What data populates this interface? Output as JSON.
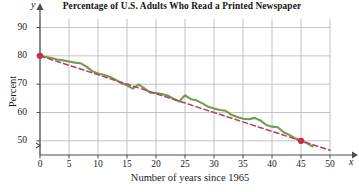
{
  "chart_data": {
    "type": "line",
    "title": "Percentage of U.S. Adults Who Read a Printed Newspaper",
    "xlabel": "Number of years since 1965",
    "ylabel": "Percent",
    "x_axis_variable": "x",
    "y_axis_variable": "y",
    "xlim": [
      0,
      50
    ],
    "ylim": [
      45,
      93
    ],
    "grid": true,
    "y_axis_break": true,
    "xticks": [
      0,
      5,
      10,
      15,
      20,
      25,
      30,
      35,
      40,
      45,
      50
    ],
    "xtick_labels": [
      "0",
      "5",
      "10",
      "15",
      "20",
      "25",
      "30",
      "35",
      "40",
      "45",
      "50"
    ],
    "yticks": [
      50,
      60,
      70,
      80,
      90
    ],
    "ytick_labels": [
      "50",
      "60",
      "70",
      "80",
      "90"
    ],
    "legend": null,
    "series": [
      {
        "name": "Percent of U.S. adults who read a printed newspaper",
        "kind": "line",
        "color": "#6d9e52",
        "style": "solid",
        "x": [
          0,
          1,
          2,
          3,
          4,
          5,
          6,
          7,
          8,
          9,
          10,
          11,
          12,
          13,
          14,
          15,
          16,
          17,
          18,
          19,
          20,
          21,
          22,
          23,
          24,
          25,
          26,
          27,
          28,
          29,
          30,
          31,
          32,
          33,
          34,
          35,
          36,
          37,
          38,
          39,
          40,
          41,
          42,
          43,
          44,
          45,
          46,
          47
        ],
        "values": [
          80.0,
          79.6,
          79.2,
          78.7,
          78.4,
          78.0,
          77.6,
          77.4,
          76.2,
          74.6,
          73.8,
          73.3,
          72.6,
          71.6,
          70.4,
          69.6,
          68.4,
          69.9,
          68.5,
          67.0,
          66.9,
          66.5,
          66.0,
          64.9,
          63.9,
          66.1,
          64.7,
          64.3,
          63.2,
          62.0,
          61.4,
          60.9,
          60.6,
          59.2,
          58.4,
          57.8,
          57.6,
          58.1,
          57.2,
          55.6,
          55.0,
          54.8,
          53.0,
          52.1,
          50.9,
          50.0,
          49.2,
          48.0
        ]
      },
      {
        "name": "Linear regression trend line",
        "kind": "line",
        "color": "#bf3b63",
        "style": "dashed",
        "x": [
          0,
          45,
          50
        ],
        "values": [
          80.0,
          50.0,
          46.7
        ]
      }
    ],
    "markers": [
      {
        "label": "start point",
        "x": 0,
        "y": 80,
        "color": "#c8304f"
      },
      {
        "label": "end point",
        "x": 45,
        "y": 50,
        "color": "#c8304f"
      }
    ],
    "colors": {
      "data_line": "#6d9e52",
      "trend_line": "#bf3b63",
      "marker": "#c8304f",
      "grid": "#b4b4b4",
      "axis": "#4d4d4d",
      "text": "#1a1a1a",
      "background": "#ffffff"
    }
  }
}
